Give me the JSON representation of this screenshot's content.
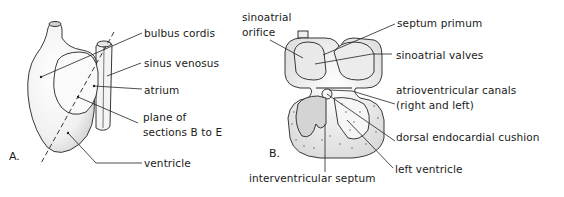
{
  "figure": {
    "panels": [
      {
        "id": "A",
        "letter": "A.",
        "labels": {
          "bulbus_cordis": "bulbus cordis",
          "sinus_venosus": "sinus venosus",
          "atrium": "atrium",
          "plane_line1": "plane of",
          "plane_line2": "sections B to E",
          "ventricle": "ventricle"
        }
      },
      {
        "id": "B",
        "letter": "B.",
        "labels": {
          "sinoatrial_orifice_line1": "sinoatrial",
          "sinoatrial_orifice_line2": "orifice",
          "septum_primum": "septum primum",
          "sinoatrial_valves": "sinoatrial valves",
          "av_canals_line1": "atrioventricular canals",
          "av_canals_line2": "(right and left)",
          "dorsal_endocardial_cushion": "dorsal endocardial cushion",
          "left_ventricle": "left ventricle",
          "interventricular_septum": "interventricular septum"
        }
      }
    ]
  }
}
